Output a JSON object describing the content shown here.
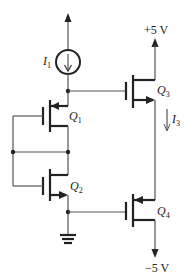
{
  "diagram": {
    "type": "circuit-schematic",
    "labels": {
      "vdd": "+5 V",
      "vss": "−5 V",
      "i1_main": "I",
      "i1_sub": "1",
      "i3_main": "I",
      "i3_sub": "3",
      "q1_main": "Q",
      "q1_sub": "1",
      "q2_main": "Q",
      "q2_sub": "2",
      "q3_main": "Q",
      "q3_sub": "3",
      "q4_main": "Q",
      "q4_sub": "4"
    },
    "components": [
      {
        "id": "I1",
        "kind": "current-source",
        "direction": "down"
      },
      {
        "id": "Q1",
        "kind": "pmos",
        "connection": "gate to common node"
      },
      {
        "id": "Q2",
        "kind": "nmos",
        "connection": "gate to common node"
      },
      {
        "id": "Q3",
        "kind": "nmos",
        "supply": "+5 V"
      },
      {
        "id": "Q4",
        "kind": "pmos",
        "supply": "-5 V"
      },
      {
        "id": "GND",
        "kind": "ground"
      }
    ],
    "colors": {
      "line": "#555555",
      "stroke": "#222222",
      "background": "#ffffff"
    }
  }
}
